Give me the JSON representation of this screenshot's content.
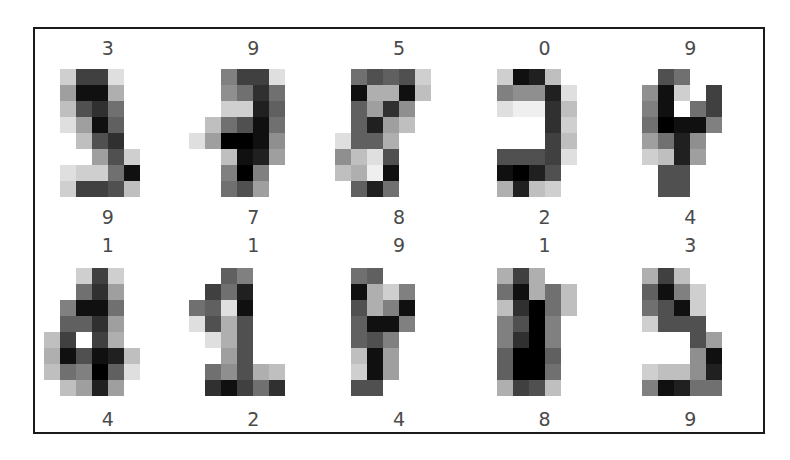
{
  "figure": {
    "background": "#ffffff",
    "frame_color": "#1a1a1a",
    "label_color": "#4a4a4a",
    "rows": 2,
    "cols": 5
  },
  "chart_data": {
    "type": "heatmap",
    "title": "",
    "xlabel": "",
    "ylabel": "",
    "colormap": "gray_r",
    "value_range": [
      0,
      16
    ],
    "grid_shape": [
      2,
      5
    ],
    "image_shape": [
      8,
      8
    ],
    "panels": [
      {
        "index": 0,
        "title": "3",
        "bottom_label": "9",
        "pixels": [
          [
            0,
            3,
            12,
            12,
            2,
            0,
            0,
            0
          ],
          [
            0,
            6,
            15,
            15,
            5,
            0,
            0,
            0
          ],
          [
            0,
            4,
            11,
            13,
            9,
            0,
            0,
            0
          ],
          [
            0,
            2,
            6,
            15,
            10,
            0,
            0,
            0
          ],
          [
            0,
            0,
            4,
            11,
            13,
            0,
            0,
            0
          ],
          [
            0,
            0,
            0,
            6,
            11,
            3,
            0,
            0
          ],
          [
            0,
            2,
            3,
            3,
            9,
            15,
            0,
            0
          ],
          [
            0,
            3,
            12,
            12,
            11,
            4,
            0,
            0
          ]
        ]
      },
      {
        "index": 1,
        "title": "9",
        "bottom_label": "7",
        "pixels": [
          [
            0,
            0,
            8,
            12,
            12,
            2,
            0,
            0
          ],
          [
            0,
            0,
            7,
            9,
            13,
            9,
            0,
            0
          ],
          [
            0,
            0,
            3,
            3,
            14,
            10,
            0,
            0
          ],
          [
            0,
            4,
            9,
            11,
            15,
            9,
            0,
            0
          ],
          [
            2,
            6,
            16,
            16,
            15,
            7,
            0,
            0
          ],
          [
            0,
            0,
            4,
            15,
            14,
            6,
            0,
            0
          ],
          [
            0,
            0,
            8,
            16,
            8,
            0,
            0,
            0
          ],
          [
            0,
            0,
            9,
            11,
            6,
            0,
            0,
            0
          ]
        ]
      },
      {
        "index": 2,
        "title": "5",
        "bottom_label": "8",
        "pixels": [
          [
            0,
            9,
            11,
            10,
            11,
            3,
            0,
            0
          ],
          [
            0,
            15,
            5,
            5,
            15,
            4,
            0,
            0
          ],
          [
            0,
            10,
            6,
            13,
            7,
            0,
            0,
            0
          ],
          [
            0,
            10,
            14,
            6,
            4,
            0,
            0,
            0
          ],
          [
            2,
            10,
            10,
            5,
            0,
            0,
            0,
            0
          ],
          [
            7,
            4,
            2,
            11,
            0,
            0,
            0,
            0
          ],
          [
            4,
            5,
            1,
            15,
            0,
            0,
            0,
            0
          ],
          [
            0,
            10,
            14,
            9,
            0,
            0,
            0,
            0
          ]
        ]
      },
      {
        "index": 3,
        "title": "0",
        "bottom_label": "2",
        "pixels": [
          [
            0,
            3,
            15,
            14,
            4,
            0,
            0,
            0
          ],
          [
            0,
            8,
            7,
            7,
            14,
            2,
            0,
            0
          ],
          [
            0,
            2,
            1,
            1,
            13,
            4,
            0,
            0
          ],
          [
            0,
            0,
            0,
            0,
            13,
            3,
            0,
            0
          ],
          [
            0,
            0,
            0,
            0,
            12,
            4,
            0,
            0
          ],
          [
            0,
            11,
            11,
            11,
            12,
            2,
            0,
            0
          ],
          [
            0,
            15,
            16,
            14,
            11,
            0,
            0,
            0
          ],
          [
            0,
            5,
            14,
            4,
            3,
            0,
            0,
            0
          ]
        ]
      },
      {
        "index": 4,
        "title": "9",
        "bottom_label": "4",
        "pixels": [
          [
            0,
            0,
            11,
            9,
            0,
            0,
            0,
            0
          ],
          [
            0,
            7,
            15,
            3,
            0,
            12,
            0,
            0
          ],
          [
            0,
            8,
            15,
            0,
            9,
            12,
            0,
            0
          ],
          [
            0,
            9,
            16,
            15,
            15,
            8,
            0,
            0
          ],
          [
            0,
            6,
            9,
            14,
            7,
            0,
            0,
            0
          ],
          [
            0,
            3,
            4,
            14,
            6,
            0,
            0,
            0
          ],
          [
            0,
            0,
            11,
            11,
            0,
            0,
            0,
            0
          ],
          [
            0,
            0,
            11,
            11,
            0,
            0,
            0,
            0
          ]
        ]
      },
      {
        "index": 5,
        "title": "1",
        "bottom_label": "4",
        "pixels": [
          [
            0,
            0,
            3,
            12,
            3,
            0,
            0,
            0
          ],
          [
            0,
            0,
            9,
            13,
            6,
            0,
            0,
            0
          ],
          [
            0,
            8,
            15,
            15,
            9,
            0,
            0,
            0
          ],
          [
            0,
            10,
            10,
            13,
            6,
            0,
            0,
            0
          ],
          [
            4,
            12,
            0,
            12,
            5,
            0,
            0,
            0
          ],
          [
            5,
            15,
            11,
            15,
            14,
            4,
            0,
            0
          ],
          [
            4,
            9,
            8,
            16,
            10,
            2,
            0,
            0
          ],
          [
            0,
            4,
            6,
            14,
            6,
            0,
            0,
            0
          ]
        ]
      },
      {
        "index": 6,
        "title": "1",
        "bottom_label": "2",
        "pixels": [
          [
            0,
            0,
            10,
            8,
            0,
            0,
            0,
            0
          ],
          [
            0,
            12,
            9,
            14,
            0,
            0,
            0,
            0
          ],
          [
            9,
            10,
            2,
            15,
            0,
            0,
            0,
            0
          ],
          [
            2,
            11,
            5,
            11,
            0,
            0,
            0,
            0
          ],
          [
            0,
            2,
            5,
            11,
            0,
            0,
            0,
            0
          ],
          [
            0,
            0,
            6,
            11,
            0,
            0,
            0,
            0
          ],
          [
            0,
            9,
            7,
            11,
            5,
            4,
            0,
            0
          ],
          [
            0,
            13,
            15,
            12,
            9,
            13,
            0,
            0
          ]
        ]
      },
      {
        "index": 7,
        "title": "9",
        "bottom_label": "4",
        "pixels": [
          [
            0,
            9,
            10,
            0,
            0,
            0,
            0,
            0
          ],
          [
            0,
            15,
            5,
            3,
            8,
            0,
            0,
            0
          ],
          [
            0,
            11,
            5,
            8,
            15,
            0,
            0,
            0
          ],
          [
            0,
            10,
            15,
            15,
            8,
            0,
            0,
            0
          ],
          [
            0,
            10,
            11,
            8,
            0,
            0,
            0,
            0
          ],
          [
            0,
            4,
            15,
            6,
            0,
            0,
            0,
            0
          ],
          [
            0,
            3,
            15,
            6,
            0,
            0,
            0,
            0
          ],
          [
            0,
            11,
            11,
            0,
            0,
            0,
            0,
            0
          ]
        ]
      },
      {
        "index": 8,
        "title": "1",
        "bottom_label": "8",
        "pixels": [
          [
            0,
            5,
            12,
            5,
            0,
            0,
            0,
            0
          ],
          [
            0,
            9,
            15,
            5,
            9,
            4,
            0,
            0
          ],
          [
            0,
            4,
            13,
            16,
            9,
            4,
            0,
            0
          ],
          [
            0,
            8,
            11,
            16,
            8,
            0,
            0,
            0
          ],
          [
            0,
            8,
            13,
            16,
            8,
            0,
            0,
            0
          ],
          [
            0,
            10,
            16,
            16,
            10,
            0,
            0,
            0
          ],
          [
            0,
            10,
            16,
            16,
            9,
            0,
            0,
            0
          ],
          [
            0,
            5,
            12,
            11,
            4,
            0,
            0,
            0
          ]
        ]
      },
      {
        "index": 9,
        "title": "3",
        "bottom_label": "9",
        "pixels": [
          [
            0,
            5,
            12,
            4,
            0,
            0,
            0,
            0
          ],
          [
            0,
            10,
            15,
            8,
            3,
            0,
            0,
            0
          ],
          [
            0,
            9,
            11,
            15,
            3,
            0,
            0,
            0
          ],
          [
            0,
            3,
            11,
            11,
            11,
            0,
            0,
            0
          ],
          [
            0,
            0,
            0,
            0,
            11,
            6,
            0,
            0
          ],
          [
            0,
            0,
            0,
            0,
            7,
            15,
            0,
            0
          ],
          [
            0,
            3,
            4,
            4,
            7,
            14,
            0,
            0
          ],
          [
            0,
            8,
            15,
            14,
            9,
            9,
            0,
            0
          ]
        ]
      }
    ]
  }
}
